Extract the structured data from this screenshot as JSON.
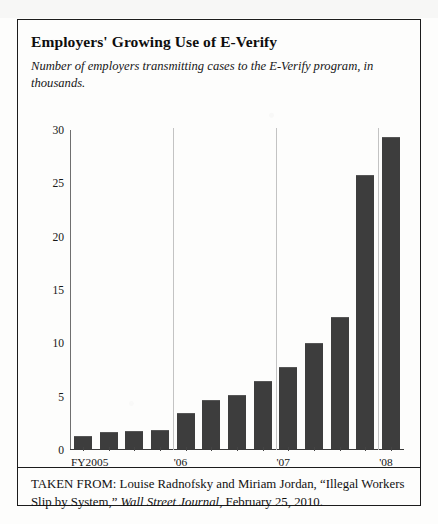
{
  "figure": {
    "title": "Employers' Growing Use of E-Verify",
    "subtitle": "Number of employers transmitting cases to the E-Verify program, in thousands.",
    "source_prefix": "TAKEN FROM: Louise Radnofsky and Miriam Jordan, “Illegal Workers Slip by System,” ",
    "source_publication": "Wall Street Journal",
    "source_suffix": ", February 25, 2010."
  },
  "chart_data": {
    "type": "bar",
    "title": "Employers' Growing Use of E-Verify",
    "subtitle": "Number of employers transmitting cases to the E-Verify program, in thousands.",
    "xlabel": "",
    "ylabel": "",
    "ylim": [
      0,
      30
    ],
    "yticks": [
      0,
      5,
      10,
      15,
      20,
      25,
      30
    ],
    "ytick_labels": [
      "0",
      "5",
      "10",
      "15",
      "20",
      "25",
      "30"
    ],
    "grid": false,
    "legend": null,
    "units": "thousands of employers",
    "group_labels": [
      "FY2005",
      "'06",
      "'07",
      "'08"
    ],
    "group_separators_after_index": [
      3,
      7,
      11
    ],
    "categories": [
      "FY2005 Q1",
      "FY2005 Q2",
      "FY2005 Q3",
      "FY2005 Q4",
      "'06 Q1",
      "'06 Q2",
      "'06 Q3",
      "'06 Q4",
      "'07 Q1",
      "'07 Q2",
      "'07 Q3",
      "'07 Q4",
      "'08 Q1"
    ],
    "values": [
      1.1,
      1.5,
      1.6,
      1.7,
      3.3,
      4.5,
      4.9,
      6.3,
      7.6,
      9.8,
      12.3,
      25.6,
      29.1
    ],
    "bar_color": "#3d3d3d"
  }
}
